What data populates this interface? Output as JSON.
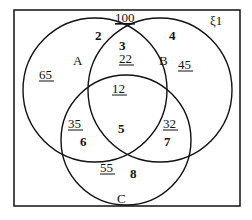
{
  "diagram": {
    "type": "venn-3",
    "universal_set_label": "ξ1",
    "universal_total": "100",
    "sets": [
      {
        "name": "A",
        "total": "65"
      },
      {
        "name": "B",
        "total": "45"
      },
      {
        "name": "C",
        "total": "55"
      }
    ],
    "pair_totals": {
      "A_and_B": "22",
      "A_and_C": "35",
      "B_and_C": "32"
    },
    "triple_total": "12",
    "region_labels": {
      "A_only": "2",
      "A_and_B_only": "3",
      "B_only": "4",
      "A_and_B_and_C": "5",
      "A_and_C_only": "6",
      "B_and_C_only": "7",
      "C_only": "8"
    },
    "colors": {
      "stroke": "#111111",
      "background": "#ffffff"
    }
  }
}
